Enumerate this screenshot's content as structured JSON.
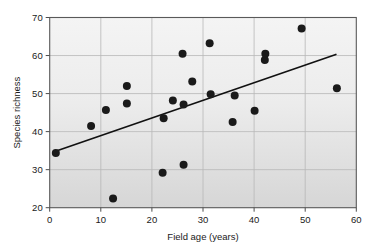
{
  "chart_data": {
    "type": "scatter",
    "title": "",
    "xlabel": "Field age (years)",
    "ylabel": "Species richness",
    "xlim": [
      0,
      60
    ],
    "ylim": [
      20,
      70
    ],
    "xticks": [
      0,
      10,
      20,
      30,
      40,
      50,
      60
    ],
    "yticks": [
      20,
      30,
      40,
      50,
      60,
      70
    ],
    "grid": true,
    "legend": null,
    "marker": {
      "shape": "circle",
      "color": "#1a1a1a",
      "size": 4
    },
    "points": [
      {
        "x": 1.2,
        "y": 34.4
      },
      {
        "x": 8.1,
        "y": 41.5
      },
      {
        "x": 11.0,
        "y": 45.7
      },
      {
        "x": 12.4,
        "y": 22.4
      },
      {
        "x": 15.1,
        "y": 52.0
      },
      {
        "x": 15.1,
        "y": 47.4
      },
      {
        "x": 22.1,
        "y": 29.2
      },
      {
        "x": 22.3,
        "y": 43.5
      },
      {
        "x": 24.1,
        "y": 48.2
      },
      {
        "x": 26.0,
        "y": 60.5
      },
      {
        "x": 26.2,
        "y": 47.1
      },
      {
        "x": 26.2,
        "y": 31.3
      },
      {
        "x": 27.9,
        "y": 53.2
      },
      {
        "x": 31.3,
        "y": 63.2
      },
      {
        "x": 31.5,
        "y": 49.8
      },
      {
        "x": 35.8,
        "y": 42.5
      },
      {
        "x": 36.2,
        "y": 49.5
      },
      {
        "x": 40.1,
        "y": 45.5
      },
      {
        "x": 42.1,
        "y": 58.8
      },
      {
        "x": 42.2,
        "y": 60.5
      },
      {
        "x": 49.3,
        "y": 67.1
      },
      {
        "x": 56.2,
        "y": 51.4
      }
    ],
    "trendline": {
      "type": "linear-fit",
      "x_start": 1.0,
      "y_start": 34.8,
      "x_end": 56.0,
      "y_end": 60.3,
      "color": "#111111",
      "width": 1.6
    },
    "style": {
      "plot_background_top": "#f2f2f2",
      "plot_background_bottom": "#d9d9d9",
      "grid_color": "#b8b8b8",
      "frame_color": "#4d4d4d",
      "text_color": "#1a1a1a"
    }
  }
}
